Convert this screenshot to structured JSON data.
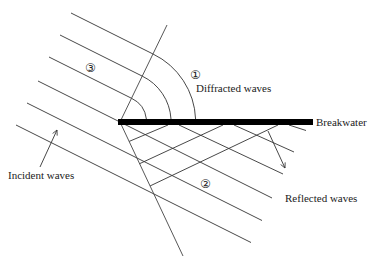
{
  "diagram": {
    "labels": {
      "incident": "Incident waves",
      "diffracted": "Diffracted waves",
      "breakwater": "Breakwater",
      "reflected": "Reflected waves"
    },
    "regions": {
      "one": "①",
      "two": "②",
      "three": "③"
    },
    "colors": {
      "breakwater": "#000000",
      "lines": "#333333",
      "background": "#ffffff"
    }
  }
}
